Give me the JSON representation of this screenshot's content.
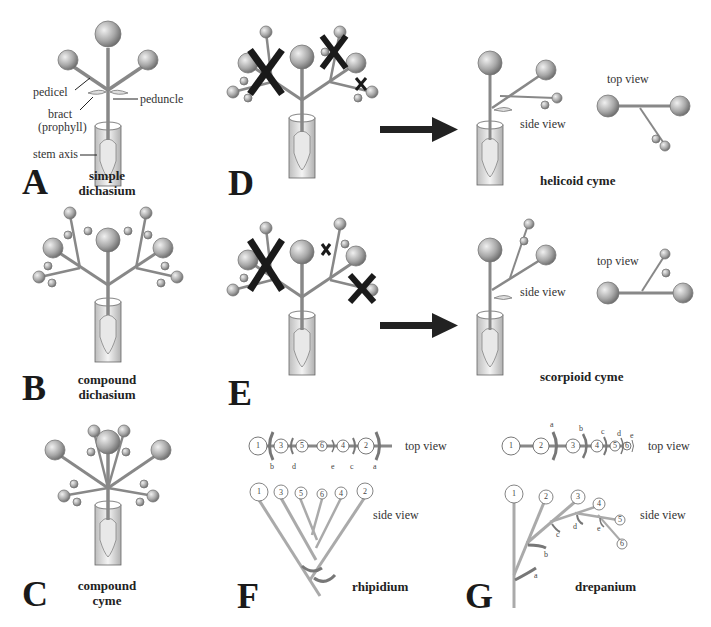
{
  "figure": {
    "panels": [
      {
        "letter": "A",
        "title_line1": "simple",
        "title_line2": "dichasium"
      },
      {
        "letter": "B",
        "title_line1": "compound",
        "title_line2": "dichasium"
      },
      {
        "letter": "C",
        "title_line1": "compound",
        "title_line2": "cyme"
      },
      {
        "letter": "D",
        "result_title": "helicoid cyme",
        "side_view": "side view",
        "top_view": "top view"
      },
      {
        "letter": "E",
        "result_title": "scorpioid cyme",
        "side_view": "side view",
        "top_view": "top view"
      },
      {
        "letter": "F",
        "title": "rhipidium",
        "side_view": "side view",
        "top_view": "top view",
        "top_flowers": [
          "1",
          "3",
          "5",
          "6",
          "4",
          "2"
        ],
        "top_bracts": [
          "b",
          "d",
          "e",
          "c",
          "a"
        ],
        "side_flowers": [
          "1",
          "3",
          "5",
          "6",
          "4",
          "2"
        ]
      },
      {
        "letter": "G",
        "title": "drepanium",
        "side_view": "side view",
        "top_view": "top view",
        "top_flowers": [
          "1",
          "2",
          "3",
          "4",
          "5",
          "6"
        ],
        "top_bracts": [
          "a",
          "b",
          "c",
          "d",
          "e"
        ],
        "side_flowers": [
          "1",
          "2",
          "3",
          "4",
          "5",
          "6"
        ],
        "side_bracts": [
          "a",
          "b",
          "c",
          "d",
          "e"
        ]
      }
    ],
    "annotations_A": {
      "pedicel": "pedicel",
      "peduncle": "peduncle",
      "bract_line1": "bract",
      "bract_line2": "(prophyll)",
      "stem_axis": "stem axis"
    },
    "arrows": [
      "D-to-helicoid",
      "E-to-scorpioid"
    ],
    "removal_marks": "X"
  }
}
